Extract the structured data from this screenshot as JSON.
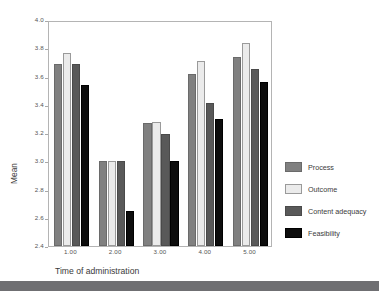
{
  "chart_data": {
    "type": "bar",
    "title": "",
    "subtitle": "",
    "xlabel": "Time of administration",
    "ylabel": "Mean",
    "categories": [
      "1.00",
      "2.00",
      "3.00",
      "4.00",
      "5.00"
    ],
    "ylim": [
      2.4,
      4.0
    ],
    "yticks": [
      "4.0",
      "3.8",
      "3.6",
      "3.4",
      "3.2",
      "3.0",
      "2.8",
      "2.6",
      "2.4"
    ],
    "ytick_values": [
      4.0,
      3.8,
      3.6,
      3.4,
      3.2,
      3.0,
      2.8,
      2.6,
      2.4
    ],
    "grid": false,
    "legend_position": "right",
    "series": [
      {
        "name": "Process",
        "color": "#808080",
        "border": "#6a6a6a",
        "values": [
          3.69,
          3.0,
          3.27,
          3.62,
          3.74
        ]
      },
      {
        "name": "Outcome",
        "color": "#ebebeb",
        "border": "#9a9a9a",
        "values": [
          3.77,
          3.0,
          3.28,
          3.71,
          3.84
        ]
      },
      {
        "name": "Content adequacy",
        "color": "#595959",
        "border": "#4a4a4a",
        "values": [
          3.69,
          3.0,
          3.19,
          3.41,
          3.65
        ]
      },
      {
        "name": "Feasibility",
        "color": "#0d0d0d",
        "border": "#000000",
        "values": [
          3.54,
          2.65,
          3.0,
          3.3,
          3.56
        ]
      }
    ]
  },
  "legend": {
    "items": [
      {
        "label": "Process"
      },
      {
        "label": "Outcome"
      },
      {
        "label": "Content adequacy"
      },
      {
        "label": "Feasibility"
      }
    ]
  },
  "axes": {
    "y_title": "Mean",
    "x_title": "Time of administration"
  }
}
